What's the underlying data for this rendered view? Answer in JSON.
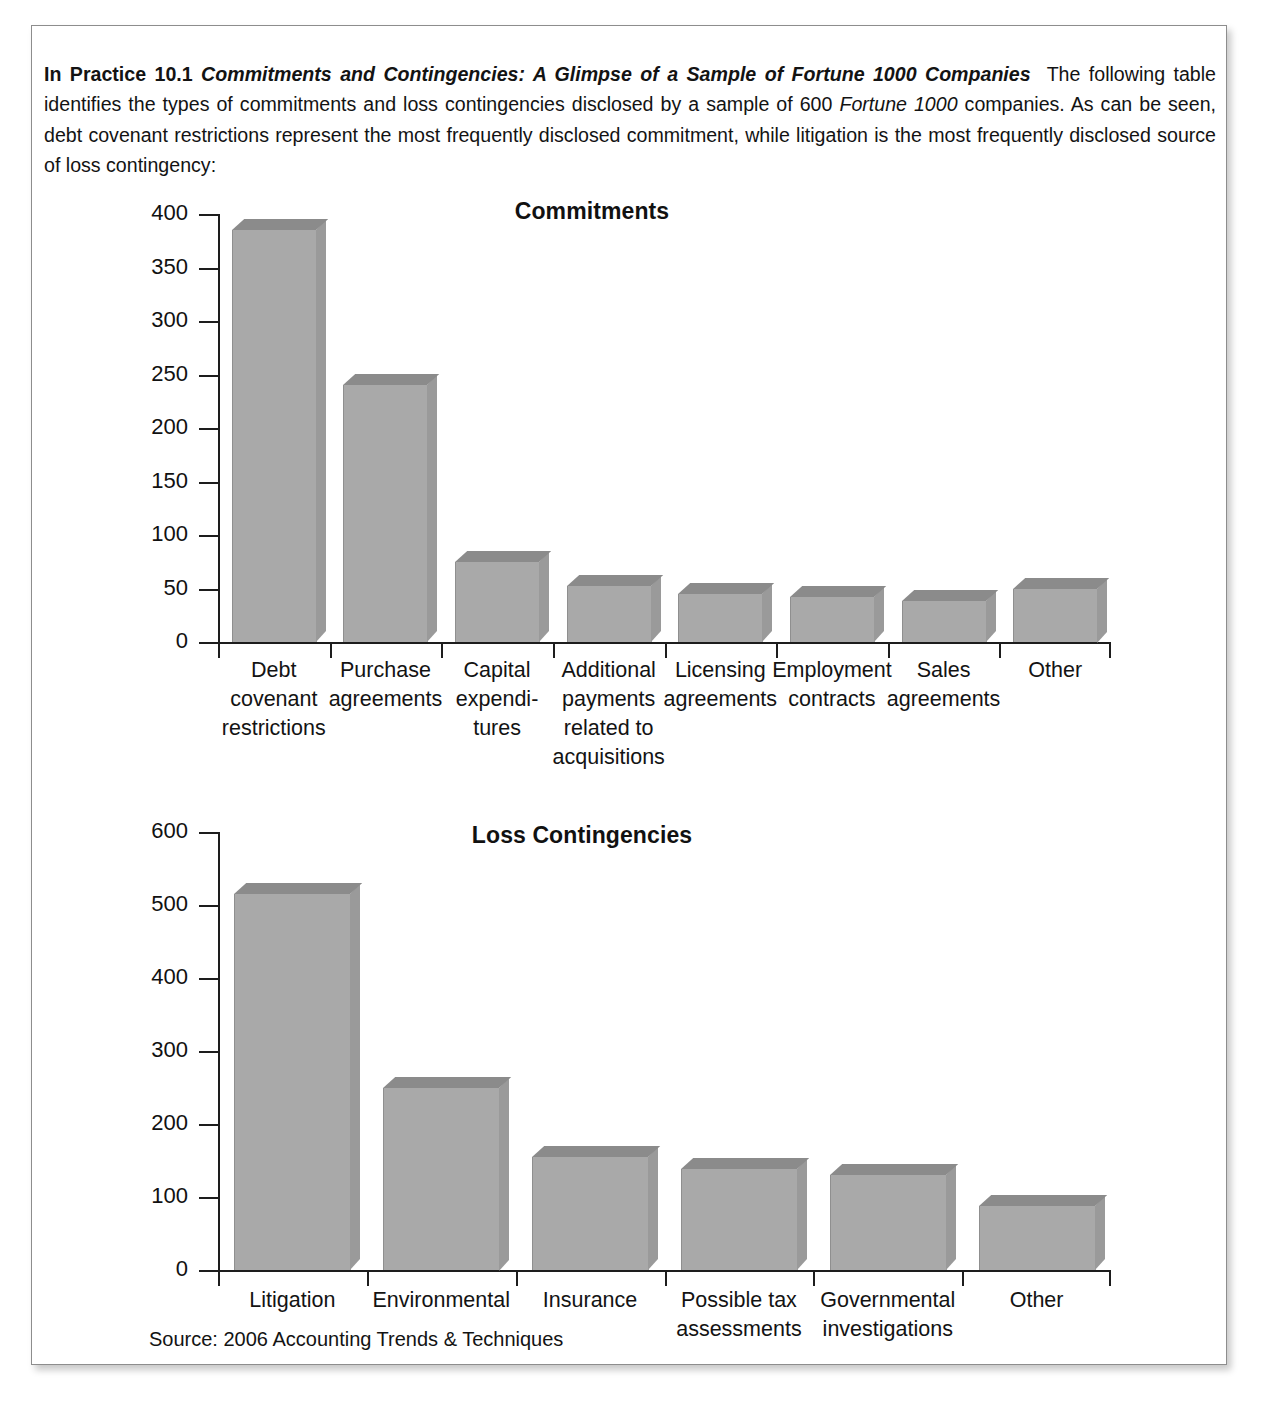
{
  "intro": {
    "label": "In Practice 10.1",
    "title": "Commitments and Contingencies: A Glimpse of a Sample of Fortune 1000 Companies",
    "body_1": "The following table identifies the types of commitments and loss contingencies disclosed by a sample of 600 ",
    "emphasis_1": "Fortune 1000",
    "body_2": " companies. As can be seen, debt covenant restrictions represent the most frequently disclosed commitment, while litigation is the most frequently disclosed source of loss contingency:"
  },
  "source_note": "Source: 2006 Accounting Trends & Techniques",
  "chart_data": [
    {
      "id": "commitments",
      "type": "bar",
      "title": "Commitments",
      "xlabel": "",
      "ylabel": "",
      "ylim": [
        0,
        400
      ],
      "yticks": [
        0,
        50,
        100,
        150,
        200,
        250,
        300,
        350,
        400
      ],
      "ytick_labels": [
        "0",
        "50",
        "100",
        "150",
        "200",
        "250",
        "300",
        "350",
        "400"
      ],
      "grid": false,
      "legend": "none",
      "categories": [
        "Debt\ncovenant\nrestrictions",
        "Purchase\nagreements",
        "Capital\nexpendi-\ntures",
        "Additional\npayments\nrelated to\nacquisitions",
        "Licensing\nagreements",
        "Employment\ncontracts",
        "Sales\nagreements",
        "Other"
      ],
      "values": [
        385,
        240,
        75,
        52,
        45,
        42,
        38,
        50
      ]
    },
    {
      "id": "loss-contingencies",
      "type": "bar",
      "title": "Loss Contingencies",
      "xlabel": "",
      "ylabel": "",
      "ylim": [
        0,
        600
      ],
      "yticks": [
        0,
        100,
        200,
        300,
        400,
        500,
        600
      ],
      "ytick_labels": [
        "0",
        "100",
        "200",
        "300",
        "400",
        "500",
        "600"
      ],
      "grid": false,
      "legend": "none",
      "categories": [
        "Litigation",
        "Environmental",
        "Insurance",
        "Possible tax\nassessments",
        "Governmental\ninvestigations",
        "Other"
      ],
      "values": [
        515,
        250,
        155,
        138,
        130,
        88
      ]
    }
  ],
  "colors": {
    "bar_face": "#a9a9a9",
    "bar_top": "#8b8b8b",
    "bar_side": "#9a9a9a",
    "axis": "#1d1d1d",
    "text": "#131313",
    "frame_border": "#8d8d8d"
  }
}
